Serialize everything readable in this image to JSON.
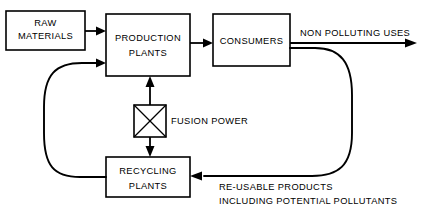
{
  "diagram": {
    "background_color": "#ffffff",
    "line_color": "#000000",
    "nodes": [
      {
        "id": "raw-materials",
        "kind": "box",
        "line1": "RAW",
        "line2": "MATERIALS"
      },
      {
        "id": "production-plants",
        "kind": "box",
        "line1": "PRODUCTION",
        "line2": "PLANTS"
      },
      {
        "id": "consumers",
        "kind": "box",
        "line1": "CONSUMERS",
        "line2": ""
      },
      {
        "id": "recycling-plants",
        "kind": "box",
        "line1": "RECYCLING",
        "line2": "PLANTS"
      },
      {
        "id": "fusion-power",
        "kind": "crossed-square-symbol",
        "label": "FUSION POWER"
      }
    ],
    "edge_labels": {
      "non_polluting_uses": "NON POLLUTING USES",
      "reusable_products_line1": "RE-USABLE PRODUCTS",
      "reusable_products_line2": "INCLUDING POTENTIAL POLLUTANTS"
    }
  }
}
